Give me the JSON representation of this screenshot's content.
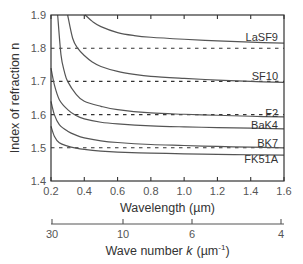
{
  "chart_data": {
    "type": "line",
    "title": "",
    "xlabel": "Wavelength (µm)",
    "ylabel": "Index of refraction n",
    "xlim": [
      0.2,
      1.6
    ],
    "ylim": [
      1.4,
      1.9
    ],
    "x_ticks": [
      0.2,
      0.4,
      0.6,
      0.8,
      1.0,
      1.2,
      1.4,
      1.6
    ],
    "x_tick_labels": [
      "0.2",
      "0.4",
      "0.6",
      "0.8",
      "1.0",
      "1.2",
      "1.4",
      "1.6"
    ],
    "y_ticks": [
      1.4,
      1.5,
      1.6,
      1.7,
      1.8,
      1.9
    ],
    "y_tick_labels": [
      "1.4",
      "1.5",
      "1.6",
      "1.7",
      "1.8",
      "1.9"
    ],
    "grid": false,
    "reference_lines": [
      1.5,
      1.6,
      1.7,
      1.8
    ],
    "secondary_x_axis": {
      "label": "Wave number k (µm⁻¹)",
      "label_prefix": "Wave number ",
      "label_var": "k",
      "label_unit": "(µm",
      "label_sup": "-1",
      "label_close": ")",
      "ticks": [
        30,
        10,
        6,
        4
      ],
      "tick_labels": [
        "30",
        "10",
        "6",
        "4"
      ],
      "tick_wavelengths": [
        0.2094,
        0.6283,
        1.0472,
        1.5708
      ]
    },
    "series": [
      {
        "name": "LaSF9",
        "x": [
          0.405,
          0.45,
          0.5,
          0.6,
          0.7,
          0.8,
          1.0,
          1.2,
          1.4,
          1.6
        ],
        "values": [
          1.9,
          1.88,
          1.865,
          1.847,
          1.838,
          1.833,
          1.827,
          1.822,
          1.818,
          1.815
        ]
      },
      {
        "name": "SF10",
        "x": [
          0.3,
          0.33,
          0.36,
          0.4,
          0.45,
          0.5,
          0.6,
          0.7,
          0.8,
          1.0,
          1.2,
          1.4,
          1.6
        ],
        "values": [
          1.9,
          1.83,
          1.8,
          1.778,
          1.758,
          1.745,
          1.73,
          1.721,
          1.715,
          1.709,
          1.704,
          1.7,
          1.697
        ]
      },
      {
        "name": "F2",
        "x": [
          0.24,
          0.26,
          0.28,
          0.3,
          0.35,
          0.4,
          0.5,
          0.6,
          0.8,
          1.0,
          1.2,
          1.4,
          1.6
        ],
        "values": [
          1.9,
          1.78,
          1.73,
          1.7,
          1.662,
          1.64,
          1.625,
          1.615,
          1.605,
          1.601,
          1.598,
          1.595,
          1.593
        ]
      },
      {
        "name": "BaK4",
        "x": [
          0.2,
          0.22,
          0.25,
          0.3,
          0.35,
          0.4,
          0.5,
          0.6,
          0.8,
          1.0,
          1.2,
          1.4,
          1.6
        ],
        "values": [
          1.74,
          1.69,
          1.645,
          1.615,
          1.597,
          1.587,
          1.577,
          1.572,
          1.566,
          1.563,
          1.561,
          1.559,
          1.557
        ]
      },
      {
        "name": "BK7",
        "x": [
          0.2,
          0.22,
          0.25,
          0.3,
          0.35,
          0.4,
          0.5,
          0.6,
          0.8,
          1.0,
          1.2,
          1.4,
          1.6
        ],
        "values": [
          1.64,
          1.6,
          1.57,
          1.55,
          1.538,
          1.53,
          1.521,
          1.516,
          1.51,
          1.507,
          1.504,
          1.502,
          1.5
        ]
      },
      {
        "name": "FK51A",
        "x": [
          0.2,
          0.22,
          0.25,
          0.3,
          0.35,
          0.4,
          0.5,
          0.6,
          0.8,
          1.0,
          1.2,
          1.4,
          1.6
        ],
        "values": [
          1.565,
          1.535,
          1.515,
          1.505,
          1.499,
          1.495,
          1.49,
          1.487,
          1.484,
          1.482,
          1.48,
          1.479,
          1.478
        ]
      }
    ],
    "legend": "inline labels at right edge"
  },
  "labels": {
    "series_label_positions": [
      {
        "name": "LaSF9",
        "n": 1.835
      },
      {
        "name": "SF10",
        "n": 1.717
      },
      {
        "name": "F2",
        "n": 1.606
      },
      {
        "name": "BaK4",
        "n": 1.57
      },
      {
        "name": "BK7",
        "n": 1.513
      },
      {
        "name": "FK51A",
        "n": 1.466
      }
    ]
  },
  "colors": {
    "curve": "#555555",
    "axis": "#333333",
    "tick_label": "#555555",
    "dashed_reference": "#333333"
  }
}
